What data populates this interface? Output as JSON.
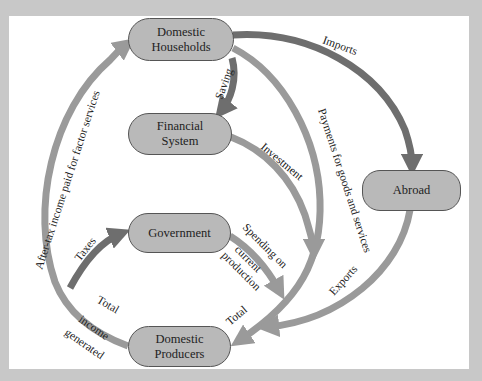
{
  "colors": {
    "background": "#c8c8c8",
    "panel": "#ffffff",
    "node_fill": "#b9b9b9",
    "node_border": "#555555",
    "arrow_light": "#9a9a9a",
    "arrow_dark": "#6e6e6e"
  },
  "nodes": {
    "households": {
      "line1": "Domestic",
      "line2": "Households"
    },
    "financial": {
      "line1": "Financial",
      "line2": "System"
    },
    "government": {
      "line1": "Government"
    },
    "producers": {
      "line1": "Domestic",
      "line2": "Producers"
    },
    "abroad": {
      "line1": "Abroad"
    }
  },
  "flows": {
    "imports": "Imports",
    "saving": "Saving",
    "payments": "Payments for goods and services",
    "investment": "Investment",
    "after_tax": "After-tax income paid for factor services",
    "taxes": "Taxes",
    "spending_1": "Spending on",
    "spending_2": "current",
    "spending_3": "production",
    "total_right": "Total",
    "total_left": "Total",
    "income": "income",
    "generated": "generated",
    "exports": "Exports"
  }
}
